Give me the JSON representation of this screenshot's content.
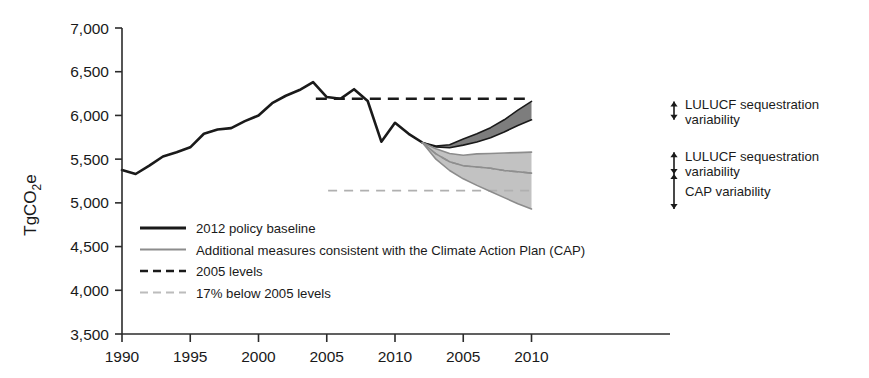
{
  "chart_data": {
    "type": "line",
    "title": "",
    "subtitle": "",
    "xlabel": "",
    "ylabel": "TgCO2e",
    "ylabel_rich": {
      "pre": "TgCO",
      "sub": "2",
      "post": "e"
    },
    "xlim": [
      1990,
      2030
    ],
    "ylim": [
      3500,
      7000
    ],
    "ytick_values": [
      3500,
      4000,
      4500,
      5000,
      5500,
      6000,
      6500,
      7000
    ],
    "ytick_labels": [
      "3,500",
      "4,000",
      "4,500",
      "5,000",
      "5,500",
      "6,000",
      "6,500",
      "7,000"
    ],
    "xtick_values": [
      1990,
      1995,
      2000,
      2005,
      2010,
      2015,
      2020
    ],
    "xtick_labels": [
      "1990",
      "1995",
      "2000",
      "2005",
      "2010",
      "2005",
      "2010"
    ],
    "grid": false,
    "legend_position": "lower-left-inside",
    "series": [
      {
        "name": "2012 policy baseline",
        "style": "solid",
        "color": "#1a1a1a",
        "width": 2.6,
        "x": [
          1990,
          1991,
          1992,
          1993,
          1994,
          1995,
          1996,
          1997,
          1998,
          1999,
          2000,
          2001,
          2002,
          2003,
          2004,
          2005,
          2006,
          2007,
          2008,
          2009,
          2010,
          2011,
          2012
        ],
        "values": [
          5375,
          5330,
          5425,
          5530,
          5580,
          5635,
          5790,
          5840,
          5855,
          5935,
          6000,
          6140,
          6225,
          6290,
          6380,
          6210,
          6190,
          6300,
          6165,
          5700,
          5915,
          5790,
          5690
        ]
      },
      {
        "name": "LULUCF sequestration variability (baseline) upper bound",
        "style": "solid",
        "color": "#1a1a1a",
        "width": 1.6,
        "x": [
          2012,
          2013,
          2014,
          2015,
          2016,
          2017,
          2018,
          2019,
          2020
        ],
        "values": [
          5690,
          5650,
          5665,
          5730,
          5790,
          5860,
          5950,
          6060,
          6160
        ]
      },
      {
        "name": "LULUCF sequestration variability (baseline) lower bound",
        "style": "solid",
        "color": "#1a1a1a",
        "width": 1.6,
        "x": [
          2012,
          2013,
          2014,
          2015,
          2016,
          2017,
          2018,
          2019,
          2020
        ],
        "values": [
          5690,
          5640,
          5630,
          5660,
          5695,
          5745,
          5810,
          5885,
          5950
        ]
      },
      {
        "name": "Additional measures consistent with the Climate Action Plan (CAP)",
        "style": "solid",
        "color": "#8c8c8c",
        "width": 1.6,
        "x": [
          2012,
          2013,
          2014,
          2015,
          2016,
          2017,
          2018,
          2019,
          2020
        ],
        "values": [
          5690,
          5560,
          5470,
          5425,
          5410,
          5395,
          5370,
          5355,
          5340
        ]
      },
      {
        "name": "CAP band upper bound",
        "style": "solid",
        "color": "#8c8c8c",
        "width": 1.6,
        "x": [
          2012,
          2013,
          2014,
          2015,
          2016,
          2017,
          2018,
          2019,
          2020
        ],
        "values": [
          5690,
          5620,
          5565,
          5545,
          5560,
          5565,
          5570,
          5575,
          5580
        ]
      },
      {
        "name": "CAP band lower bound",
        "style": "solid",
        "color": "#8c8c8c",
        "width": 1.6,
        "x": [
          2012,
          2013,
          2014,
          2015,
          2016,
          2017,
          2018,
          2019,
          2020
        ],
        "values": [
          5690,
          5500,
          5370,
          5275,
          5200,
          5130,
          5060,
          4990,
          4930
        ]
      }
    ],
    "bands": [
      {
        "name": "LULUCF sequestration variability band (baseline)",
        "fill": "#7d7d7d",
        "stroke": "#1a1a1a",
        "x": [
          2012,
          2013,
          2014,
          2015,
          2016,
          2017,
          2018,
          2019,
          2020
        ],
        "upper": [
          5690,
          5650,
          5665,
          5730,
          5790,
          5860,
          5950,
          6060,
          6160
        ],
        "lower": [
          5690,
          5640,
          5630,
          5660,
          5695,
          5745,
          5810,
          5885,
          5950
        ]
      },
      {
        "name": "CAP variability band",
        "fill": "#c2c2c2",
        "stroke": "#8c8c8c",
        "x": [
          2012,
          2013,
          2014,
          2015,
          2016,
          2017,
          2018,
          2019,
          2020
        ],
        "upper": [
          5690,
          5620,
          5565,
          5545,
          5560,
          5565,
          5570,
          5575,
          5580
        ],
        "lower": [
          5690,
          5500,
          5370,
          5275,
          5200,
          5130,
          5060,
          4990,
          4930
        ]
      }
    ],
    "reference_lines": [
      {
        "name": "2005 levels",
        "value": 6190,
        "style": "dashed",
        "color": "#1a1a1a",
        "x_start": 2004.2,
        "x_end": 2020
      },
      {
        "name": "17% below 2005 levels",
        "value": 5140,
        "style": "dashed",
        "color": "#b0b0b0",
        "x_start": 2005.1,
        "x_end": 2020
      }
    ],
    "annotations": [
      {
        "name": "lulucf-baseline-annotation",
        "label_line1": "LULUCF sequestration",
        "label_line2": "variability",
        "target_value_top": 6160,
        "target_value_bottom": 5950
      },
      {
        "name": "lulucf-cap-annotation",
        "label_line1": "LULUCF sequestration",
        "label_line2": "variability",
        "target_value_top": 5580,
        "target_value_bottom": 5330
      },
      {
        "name": "cap-variability-annotation",
        "label_line1": "CAP variability",
        "label_line2": "",
        "target_value_top": 5330,
        "target_value_bottom": 4930
      }
    ],
    "legend_entries": [
      {
        "label": "2012 policy baseline",
        "style": "solid",
        "color": "#1a1a1a",
        "width": 2.8
      },
      {
        "label": "Additional measures consistent with the Climate Action Plan (CAP)",
        "style": "solid",
        "color": "#8c8c8c",
        "width": 2.0
      },
      {
        "label": "2005 levels",
        "style": "dashed",
        "color": "#1a1a1a",
        "width": 2.6
      },
      {
        "label": "17% below 2005 levels",
        "style": "dashed",
        "color": "#bcbcbc",
        "width": 2.0
      }
    ]
  }
}
